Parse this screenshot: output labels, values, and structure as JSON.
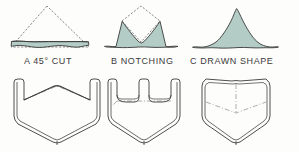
{
  "figure": {
    "background_color": "#fdfdfc",
    "fill_color": "#b3cdc6",
    "outline_color": "#3a3a3a",
    "dashed_color": "#8a8a8a",
    "caption_color": "#3b3b3b",
    "top_row_title": "cross-section profiles",
    "bottom_row_title": "formed sheet metal shapes"
  },
  "captions": {
    "a": "A  45° CUT",
    "b": "B  NOTCHING",
    "c": "C  DRAWN SHAPE"
  },
  "profiles": [
    {
      "id": "a",
      "label": "A  45° CUT",
      "description": "shallow base sliver under dashed triangle outline",
      "dashed_triangle": "47,6 11,47 89,47",
      "filled_path": "M 11,47 L 89,47 L 89,42 L 11,42 Z"
    },
    {
      "id": "b",
      "label": "B  NOTCHING",
      "description": "triangle with central V notch removed leaving two peaks",
      "dashed_triangle": "141,6 105,47 177,47",
      "filled_path": "M 105,47 L 123,22 L 141,44 L 159,22 L 177,47 Z"
    },
    {
      "id": "c",
      "label": "C  DRAWN SHAPE",
      "description": "fully filled rounded mound triangle",
      "filled_path": "M 193,48 L 236,8 L 278,48 Z"
    }
  ],
  "formed_shapes": [
    {
      "id": "box-a",
      "description": "tray with V-shaped rear gap from 45 degree cut corners",
      "notch": "v-gap"
    },
    {
      "id": "box-b",
      "description": "tray with U-shaped rear notch slot",
      "notch": "u-slot"
    },
    {
      "id": "box-c",
      "description": "seamless drawn tray with no notch",
      "notch": "none"
    }
  ]
}
